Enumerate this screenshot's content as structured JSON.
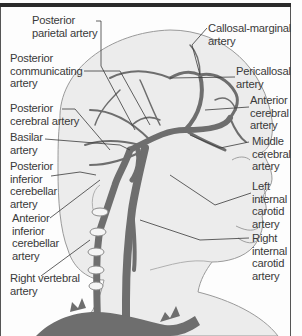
{
  "diagram": {
    "type": "anatomical illustration",
    "colors": {
      "artery": "#6e6e6e",
      "skin_fill": "#ececec",
      "outline": "#9a9a9a",
      "leader_line": "#3a3a3a",
      "text": "#3a3a3a",
      "border": "#2a2a2a"
    },
    "labels": {
      "posterior_parietal": "Posterior\nparietal artery",
      "posterior_communicating": "Posterior\ncommunicating\nartery",
      "posterior_cerebral": "Posterior\ncerebral artery",
      "basilar": "Basilar\nartery",
      "posterior_inferior_cerebellar": "Posterior\ninferior\ncerebellar\nartery",
      "anterior_inferior_cerebellar": "Anterior\ninferior\ncerebellar\nartery",
      "right_vertebral": "Right vertebral\nartery",
      "callosal_marginal": "Callosal-marginal\nartery",
      "pericallosal": "Pericallosal\nartery",
      "anterior_cerebral": "Anterior\ncerebral\nartery",
      "middle_cerebral": "Middle\ncerebral\nartery",
      "left_internal_carotid": "Left\ninternal\ncarotid\nartery",
      "right_internal_carotid": "Right\ninternal\ncarotid\nartery"
    }
  }
}
